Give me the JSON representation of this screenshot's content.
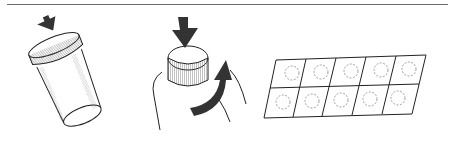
{
  "illustration": {
    "rule_color": "#6b6b6b",
    "ink_color": "#222222",
    "hatch_color": "#777777",
    "steps": [
      {
        "id": "step-1",
        "description": "tilted pill bottle with child-resistant cap, arrow pressing down on cap edge"
      },
      {
        "id": "step-2",
        "description": "hand pressing down on cap and twisting counter-clockwise"
      },
      {
        "id": "step-3",
        "description": "blister pack with 10 tablets in 2 rows of 5"
      }
    ],
    "blister_pack": {
      "rows": 2,
      "columns": 5
    }
  }
}
